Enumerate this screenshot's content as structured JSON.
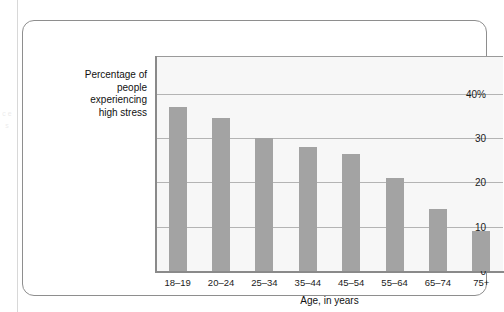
{
  "chart_data": {
    "type": "bar",
    "title": "",
    "subtitle": "",
    "xlabel": "Age, in years",
    "ylabel": "Percentage of people experiencing high stress",
    "ylabel_lines": [
      "Percentage of",
      "people",
      "experiencing",
      "high stress"
    ],
    "categories": [
      "18–19",
      "20–24",
      "25–34",
      "35–44",
      "45–54",
      "55–64",
      "65–74",
      "75+"
    ],
    "values": [
      37,
      34.5,
      30,
      28,
      26.5,
      21,
      14,
      9
    ],
    "ylim": [
      0,
      48.5
    ],
    "yticks": [
      0,
      10,
      20,
      30,
      40
    ],
    "ytick_labels": [
      "0",
      "10",
      "20",
      "30",
      "40%"
    ],
    "grid": "horizontal",
    "legend": "none",
    "bar_color": "#a3a3a3",
    "plot_background": "#f7f7f7",
    "gridline_color": "#b4b4b4",
    "axis_color": "#8a8a8a",
    "frame_color": "#8e8e8e"
  },
  "page_bleed": {
    "text": "c e s"
  }
}
